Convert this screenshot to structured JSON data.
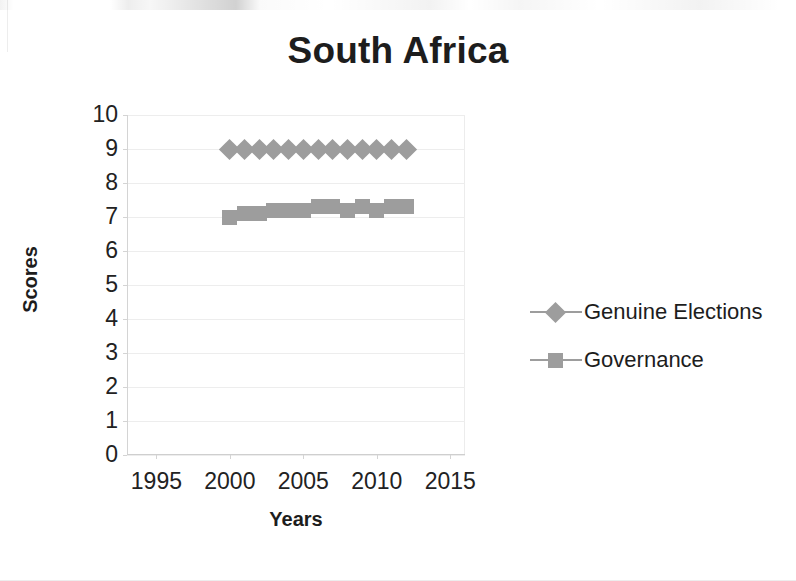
{
  "chart_data": {
    "type": "line",
    "title": "South Africa",
    "xlabel": "Years",
    "ylabel": "Scores",
    "xlim": [
      1993,
      2016
    ],
    "ylim": [
      0,
      10
    ],
    "xticks": [
      1995,
      2000,
      2005,
      2010,
      2015
    ],
    "yticks": [
      0,
      1,
      2,
      3,
      4,
      5,
      6,
      7,
      8,
      9,
      10
    ],
    "grid": "horizontal",
    "legend_position": "right",
    "x": [
      2000,
      2001,
      2002,
      2003,
      2004,
      2005,
      2006,
      2007,
      2008,
      2009,
      2010,
      2011,
      2012
    ],
    "series": [
      {
        "name": "Genuine Elections",
        "marker": "diamond",
        "color": "#9d9d9d",
        "values": [
          9,
          9,
          9,
          9,
          9,
          9,
          9,
          9,
          9,
          9,
          9,
          9,
          9
        ]
      },
      {
        "name": "Governance",
        "marker": "square",
        "color": "#9d9d9d",
        "values": [
          7.0,
          7.1,
          7.1,
          7.2,
          7.2,
          7.2,
          7.3,
          7.3,
          7.2,
          7.3,
          7.2,
          7.3,
          7.3
        ]
      }
    ]
  },
  "chart": {
    "title": "South Africa",
    "x_axis_title": "Years",
    "y_axis_title": "Scores",
    "x_tick_labels": [
      "1995",
      "2000",
      "2005",
      "2010",
      "2015"
    ],
    "y_tick_labels": [
      "10",
      "9",
      "8",
      "7",
      "6",
      "5",
      "4",
      "3",
      "2",
      "1",
      "0"
    ],
    "legend": [
      {
        "label": "Genuine Elections",
        "marker": "diamond",
        "color": "#9d9d9d"
      },
      {
        "label": "Governance",
        "marker": "square",
        "color": "#9d9d9d"
      }
    ]
  }
}
